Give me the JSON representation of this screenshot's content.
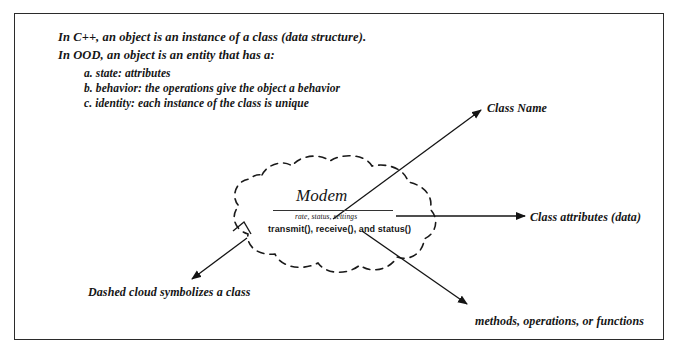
{
  "document": {
    "title": "OOD class cloud diagram",
    "background_color": "#ffffff",
    "border_color": "#2b2b2b",
    "ink_color": "#151515"
  },
  "intro": {
    "line_1": "In C++, an object is an instance of a class (data structure).",
    "line_2": "In OOD, an object is an entity that has a:",
    "items": [
      "a. state: attributes",
      "b. behavior: the operations give  the object a behavior",
      "c. identity: each instance of the class is unique"
    ]
  },
  "class_box": {
    "name": "Modem",
    "attributes": "rate, status, settings",
    "methods": "transmit(), receive(), and status()"
  },
  "callouts": [
    {
      "id": "class-name",
      "label": "Class Name"
    },
    {
      "id": "class-attributes",
      "label": "Class attributes (data)"
    },
    {
      "id": "methods",
      "label": "methods, operations, or functions"
    },
    {
      "id": "dashed-cloud",
      "label": "Dashed cloud symbolizes a class"
    }
  ],
  "shapes": {
    "cloud": {
      "style": "dashed",
      "stroke": "#1a1a1a",
      "dash": "7 6"
    },
    "arrows": [
      {
        "name": "arrow-to-class-name",
        "from": [
          333,
          219
        ],
        "to": [
          480,
          110
        ]
      },
      {
        "name": "arrow-to-class-attributes",
        "from": [
          395,
          216
        ],
        "to": [
          524,
          216
        ]
      },
      {
        "name": "arrow-to-methods",
        "from": [
          363,
          231
        ],
        "to": [
          466,
          303
        ]
      },
      {
        "name": "arrow-to-dashed-cloud",
        "from": [
          247,
          238
        ],
        "to": [
          193,
          278
        ]
      }
    ]
  }
}
